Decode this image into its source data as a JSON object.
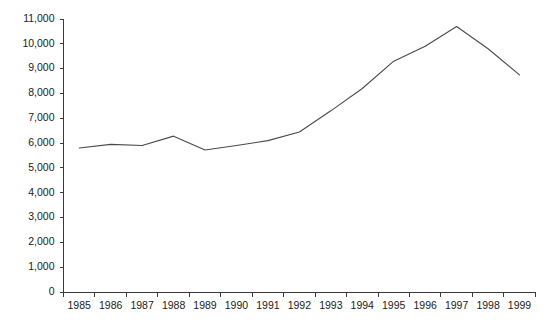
{
  "chart_data": {
    "type": "line",
    "title": "",
    "subtitle": "",
    "xlabel": "",
    "ylabel": "",
    "categories": [
      "1985",
      "1986",
      "1987",
      "1988",
      "1989",
      "1990",
      "1991",
      "1992",
      "1993",
      "1994",
      "1995",
      "1996",
      "1997",
      "1998",
      "1999"
    ],
    "values": [
      5800,
      5950,
      5900,
      6280,
      5720,
      5900,
      6100,
      6450,
      7300,
      8200,
      9300,
      9900,
      10700,
      9800,
      8750
    ],
    "series": [
      {
        "name": "",
        "values": [
          5800,
          5950,
          5900,
          6280,
          5720,
          5900,
          6100,
          6450,
          7300,
          8200,
          9300,
          9900,
          10700,
          9800,
          8750
        ]
      }
    ],
    "ylim": [
      0,
      11000
    ],
    "ytick_values": [
      0,
      1000,
      2000,
      3000,
      4000,
      5000,
      6000,
      7000,
      8000,
      9000,
      10000,
      11000
    ],
    "ytick_labels": [
      "0",
      "1,000",
      "2,000",
      "3,000",
      "4,000",
      "5,000",
      "6,000",
      "7,000",
      "8,000",
      "9,000",
      "10,000",
      "11,000"
    ],
    "xtick_labels": [
      "1985",
      "1986",
      "1987",
      "1988",
      "1989",
      "1990",
      "1991",
      "1992",
      "1993",
      "1994",
      "1995",
      "1996",
      "1997",
      "1998",
      "1999"
    ],
    "grid": false,
    "legend": null,
    "legend_position": "none",
    "annotations": [],
    "line_color": "#4a4a4a",
    "axis_color": "#3a3a3a",
    "background_color": "#ffffff"
  }
}
